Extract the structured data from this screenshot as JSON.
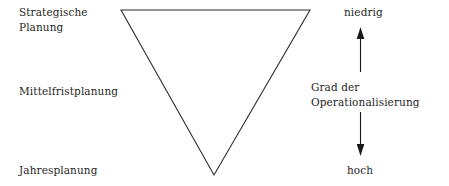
{
  "figure": {
    "background_color": "#ffffff",
    "ink_color": "#2b2b2b"
  },
  "triangle": {
    "name": "inverted-triangle",
    "vertices": [
      {
        "label": "top-left",
        "x": 121,
        "y": 10
      },
      {
        "label": "top-right",
        "x": 310,
        "y": 10
      },
      {
        "label": "bottom-apex",
        "x": 214,
        "y": 175
      }
    ],
    "points": "121,10 310,10 214,175",
    "stroke_color": "#2b2b2b",
    "fill": "none"
  },
  "levels": [
    {
      "id": "strategic",
      "label": "Strategische\nPlanung"
    },
    {
      "id": "midterm",
      "label": "Mittelfristplanung"
    },
    {
      "id": "annual",
      "label": "Jahresplanung"
    }
  ],
  "axis": {
    "caption": "Grad der\nOperationalisierung",
    "top_label": "niedrig",
    "bottom_label": "hoch",
    "up_arrow": {
      "x": 360,
      "y_tip": 28,
      "y_tail": 72
    },
    "down_arrow": {
      "x": 360,
      "y_tail": 112,
      "y_tip": 156
    },
    "arrow_color": "#1a1a1a"
  }
}
